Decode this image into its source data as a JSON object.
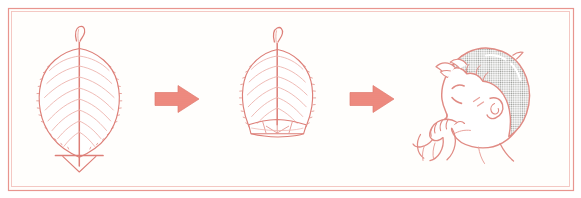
{
  "figure": {
    "description": "Three-panel line-art sequence showing how to fold a leaf into a whistle and blow it",
    "background_color": "#ffffff",
    "panel_background_color": "#fffefc"
  },
  "frame": {
    "name": "outer-border",
    "stroke_color": "#e8958f",
    "inner_stroke_color": "#f3c3bd",
    "stroke_width": 1.2,
    "x": 8,
    "y": 8,
    "width": 565,
    "height": 182
  },
  "palette": {
    "line": "#dd7f78",
    "line_light": "#ecb0aa",
    "line_pale": "#f2cac5",
    "arrow_fill": "#ef8d82",
    "arrow_stroke": "#e07a6f",
    "hair_gray": "#a8aaa6",
    "hair_gray_light": "#c9cbc7",
    "skin_line": "#e08b84",
    "white": "#ffffff"
  },
  "steps": [
    {
      "index": 1,
      "name": "whole-leaf",
      "label": "Whole leaf with fold line",
      "center_x": 79,
      "center_y": 100,
      "details": [
        "serrated elliptical blade",
        "central midrib",
        "paired lateral veins",
        "hooked stem at top",
        "horizontal fold guide line near base",
        "V-shaped leaf tip below fold line"
      ]
    },
    {
      "index": 2,
      "name": "folded-leaf",
      "label": "Leaf with base folded up",
      "center_x": 277,
      "center_y": 95,
      "details": [
        "serrated blade with flattened folded bottom",
        "fold crease lines forming a flap",
        "central midrib",
        "hooked stem at top"
      ]
    },
    {
      "index": 3,
      "name": "child-blowing-leaf",
      "label": "Child blowing the leaf whistle",
      "center_x": 480,
      "center_y": 100,
      "details": [
        "head in left-facing profile",
        "gray halftone stippled hair",
        "closed eye and eyebrow",
        "ear",
        "hand holding folded leaf at lips",
        "puckered mouth blowing"
      ]
    }
  ],
  "arrows": [
    {
      "name": "arrow-step1-to-step2",
      "label": "then",
      "x": 155,
      "y": 99,
      "length": 44,
      "direction": "right"
    },
    {
      "name": "arrow-step2-to-step3",
      "label": "then",
      "x": 350,
      "y": 99,
      "length": 44,
      "direction": "right"
    }
  ]
}
